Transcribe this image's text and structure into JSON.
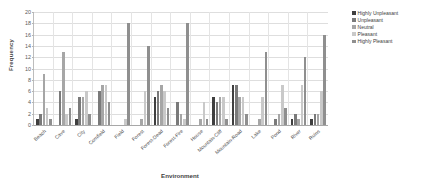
{
  "chart_data": {
    "type": "bar",
    "title": "",
    "xlabel": "Environment",
    "ylabel": "Frequency",
    "ylim": [
      0,
      20
    ],
    "ytick_step": 2,
    "yticks": [
      0,
      2,
      4,
      6,
      8,
      10,
      12,
      14,
      16,
      18,
      20
    ],
    "grid": true,
    "legend_position": "right",
    "categories": [
      "Beach",
      "Cave",
      "City",
      "Cornfield",
      "Field",
      "Forest",
      "Forest-Dead",
      "Forest-Fire",
      "House",
      "Mountain-Cliff",
      "Mountain-Road",
      "Lake",
      "Pond",
      "River",
      "Ruins"
    ],
    "series": [
      {
        "name": "Highly Unpleasant",
        "color": "#3f3f3f",
        "values": [
          1,
          0,
          1,
          0,
          0,
          0,
          5,
          0,
          0,
          5,
          7,
          0,
          0,
          1,
          1
        ]
      },
      {
        "name": "Unpleasant",
        "color": "#7a7a7a",
        "values": [
          2,
          6,
          5,
          6,
          0,
          0,
          6,
          4,
          0,
          4,
          7,
          0,
          1,
          2,
          2
        ]
      },
      {
        "name": "Neutral",
        "color": "#a6a6a6",
        "values": [
          9,
          13,
          5,
          7,
          0,
          1,
          7,
          2,
          1,
          5,
          5,
          1,
          2,
          1,
          2
        ]
      },
      {
        "name": "Pleasant",
        "color": "#c9c9c9",
        "values": [
          3,
          2,
          6,
          7,
          1,
          6,
          6,
          1,
          4,
          5,
          5,
          5,
          7,
          7,
          6
        ]
      },
      {
        "name": "Highly Pleasant",
        "color": "#8f8f8f",
        "values": [
          1,
          3,
          2,
          4,
          18,
          14,
          3,
          18,
          1,
          1,
          2,
          13,
          3,
          12,
          16
        ]
      }
    ]
  }
}
